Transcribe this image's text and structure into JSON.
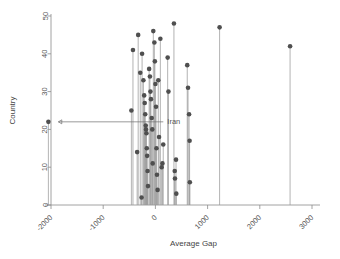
{
  "chart_data": {
    "type": "scatter",
    "plot_style": "lollipop-stem",
    "title": "",
    "xlabel": "Average Gap",
    "ylabel": "Country",
    "xlim": [
      -2400,
      3100
    ],
    "ylim": [
      0,
      51
    ],
    "xticks": [
      -2000,
      -1000,
      0,
      1000,
      2000,
      3000
    ],
    "xtick_labels": [
      "-2000",
      "-1000",
      "0",
      "1000",
      "2000",
      "3000"
    ],
    "yticks": [
      0,
      10,
      20,
      30,
      40,
      50
    ],
    "ytick_labels": [
      "0",
      "10",
      "20",
      "30",
      "40",
      "50"
    ],
    "xtick_label_rotation": -45,
    "ytick_label_rotation": -90,
    "grid": false,
    "legend": false,
    "point_color": "#4f4f4f",
    "stem_color": "#9a9a9a",
    "axis_color": "#8c8c8c",
    "baseline": 0,
    "annotations": [
      {
        "text": "Iran",
        "kind": "arrow-label",
        "target_x": -2050,
        "target_y": 22,
        "label_x": 420,
        "label_y": 21,
        "arrow_direction": "left"
      }
    ],
    "points": [
      {
        "x": -2050,
        "y": 22
      },
      {
        "x": -430,
        "y": 41
      },
      {
        "x": -460,
        "y": 25
      },
      {
        "x": -330,
        "y": 45
      },
      {
        "x": -350,
        "y": 14
      },
      {
        "x": -290,
        "y": 35
      },
      {
        "x": -255,
        "y": 40
      },
      {
        "x": -265,
        "y": 2
      },
      {
        "x": -230,
        "y": 33
      },
      {
        "x": -215,
        "y": 29
      },
      {
        "x": -205,
        "y": 27
      },
      {
        "x": -195,
        "y": 24
      },
      {
        "x": -185,
        "y": 21
      },
      {
        "x": -180,
        "y": 20
      },
      {
        "x": -172,
        "y": 19
      },
      {
        "x": -165,
        "y": 15
      },
      {
        "x": -158,
        "y": 13
      },
      {
        "x": -150,
        "y": 9
      },
      {
        "x": -142,
        "y": 5
      },
      {
        "x": -120,
        "y": 36
      },
      {
        "x": -105,
        "y": 34
      },
      {
        "x": -95,
        "y": 30
      },
      {
        "x": -85,
        "y": 28
      },
      {
        "x": -70,
        "y": 23
      },
      {
        "x": -60,
        "y": 20
      },
      {
        "x": -52,
        "y": 11
      },
      {
        "x": -40,
        "y": 46
      },
      {
        "x": -20,
        "y": 43
      },
      {
        "x": -10,
        "y": 38
      },
      {
        "x": 0,
        "y": 32
      },
      {
        "x": 12,
        "y": 26
      },
      {
        "x": 20,
        "y": 15
      },
      {
        "x": 30,
        "y": 8
      },
      {
        "x": 42,
        "y": 4
      },
      {
        "x": 55,
        "y": 33
      },
      {
        "x": 70,
        "y": 18
      },
      {
        "x": 95,
        "y": 44
      },
      {
        "x": 120,
        "y": 10
      },
      {
        "x": 135,
        "y": 11
      },
      {
        "x": 150,
        "y": 16
      },
      {
        "x": 235,
        "y": 39
      },
      {
        "x": 250,
        "y": 30
      },
      {
        "x": 355,
        "y": 48
      },
      {
        "x": 370,
        "y": 9
      },
      {
        "x": 375,
        "y": 7
      },
      {
        "x": 395,
        "y": 12
      },
      {
        "x": 400,
        "y": 3
      },
      {
        "x": 610,
        "y": 37
      },
      {
        "x": 625,
        "y": 31
      },
      {
        "x": 645,
        "y": 24
      },
      {
        "x": 655,
        "y": 17
      },
      {
        "x": 660,
        "y": 6
      },
      {
        "x": 1230,
        "y": 47
      },
      {
        "x": 2580,
        "y": 42
      }
    ]
  }
}
